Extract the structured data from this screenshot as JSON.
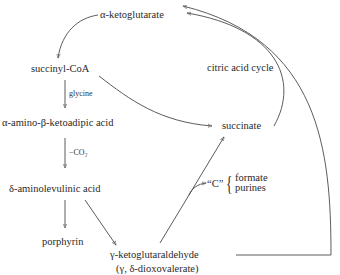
{
  "diagram": {
    "title": "",
    "nodes": {
      "alpha_ketoglutarate": "α-ketoglutarate",
      "succinyl_coa": "succinyl-CoA",
      "alpha_amino_beta_ketoadipic_acid": "α-amino-β-ketoadipic acid",
      "delta_aminolevulinic_acid": "δ-aminolevulinic acid",
      "porphyrin": "porphyrin",
      "gamma_ketoglutaraldehyde": "γ-ketoglutaraldehyde",
      "gamma_ketoglutaraldehyde_alt": "(γ, δ-dioxovalerate)",
      "succinate": "succinate",
      "citric_acid_cycle": "citric acid cycle",
      "c_unit": "“C”",
      "c_products": [
        "formate",
        "purines"
      ]
    },
    "edge_labels": {
      "glycine": "glycine",
      "minus_co2": "−CO₂"
    },
    "edges": [
      {
        "from": "α-ketoglutarate",
        "to": "succinyl-CoA"
      },
      {
        "from": "succinyl-CoA",
        "to": "α-amino-β-ketoadipic acid",
        "label": "glycine"
      },
      {
        "from": "succinyl-CoA",
        "to": "succinate"
      },
      {
        "from": "α-amino-β-ketoadipic acid",
        "to": "δ-aminolevulinic acid",
        "label": "−CO₂"
      },
      {
        "from": "δ-aminolevulinic acid",
        "to": "porphyrin"
      },
      {
        "from": "δ-aminolevulinic acid",
        "to": "γ-ketoglutaraldehyde"
      },
      {
        "from": "γ-ketoglutaraldehyde",
        "to": "succinate"
      },
      {
        "from": "γ-ketoglutaraldehyde",
        "to": "“C”"
      },
      {
        "from": "succinate",
        "to": "α-ketoglutarate",
        "label": "citric acid cycle"
      },
      {
        "from": "γ-ketoglutaraldehyde",
        "to": "α-ketoglutarate"
      }
    ],
    "colors": {
      "ink": "#2a2a2a",
      "background": "#ffffff"
    }
  }
}
